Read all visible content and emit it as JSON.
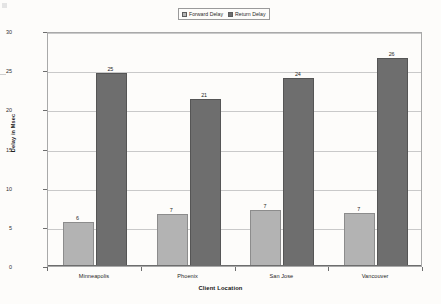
{
  "chart_data": {
    "type": "bar",
    "title": "",
    "xlabel": "Client Location",
    "ylabel": "Delay in Msec",
    "categories": [
      "Minneapolis",
      "Phoenix",
      "San Jose",
      "Vancouver"
    ],
    "series": [
      {
        "name": "Forward Delay",
        "color": "#b3b3b3",
        "values": [
          6,
          7,
          7,
          7
        ],
        "plotted": [
          5.6,
          6.6,
          7.2,
          6.8
        ],
        "labels": [
          "6",
          "7",
          "7",
          "7"
        ]
      },
      {
        "name": "Return Delay",
        "color": "#6e6e6e",
        "values": [
          25,
          21,
          24,
          26
        ],
        "plotted": [
          24.6,
          21.3,
          24.0,
          26.5
        ],
        "labels": [
          "25",
          "21",
          "24",
          "26"
        ]
      }
    ],
    "ylim": [
      0,
      30
    ],
    "yticks": [
      0,
      5,
      10,
      15,
      20,
      25,
      30
    ],
    "ytick_labels": [
      "0",
      "5",
      "10",
      "15",
      "20",
      "25",
      "30"
    ],
    "grid": true,
    "legend_position": "top-center"
  },
  "legend": {
    "entries": [
      {
        "label": "Forward Delay",
        "swatch": "forward"
      },
      {
        "label": "Return Delay",
        "swatch": "return"
      }
    ]
  }
}
